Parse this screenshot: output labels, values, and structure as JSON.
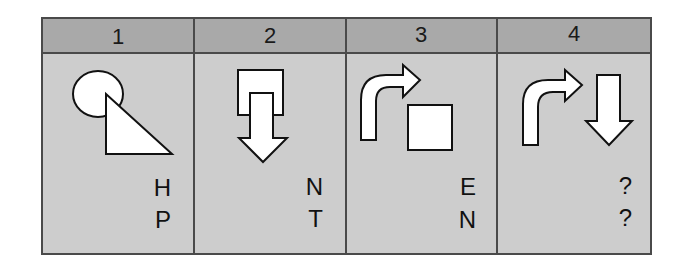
{
  "colors": {
    "header_bg": "#a9a9a9",
    "body_bg": "#cdcdcd",
    "border": "#4a4a4a",
    "shape_fill": "#ffffff",
    "shape_stroke": "#111111"
  },
  "panels": [
    {
      "number": "1",
      "shapes": [
        "circle",
        "right-triangle"
      ],
      "code": {
        "line1": "H",
        "line2": "P"
      }
    },
    {
      "number": "2",
      "shapes": [
        "open-rectangle",
        "down-arrow"
      ],
      "code": {
        "line1": "N",
        "line2": "T"
      }
    },
    {
      "number": "3",
      "shapes": [
        "curved-right-arrow",
        "square"
      ],
      "code": {
        "line1": "E",
        "line2": "N"
      }
    },
    {
      "number": "4",
      "shapes": [
        "curved-right-arrow",
        "down-arrow"
      ],
      "code": {
        "line1": "?",
        "line2": "?"
      }
    }
  ]
}
